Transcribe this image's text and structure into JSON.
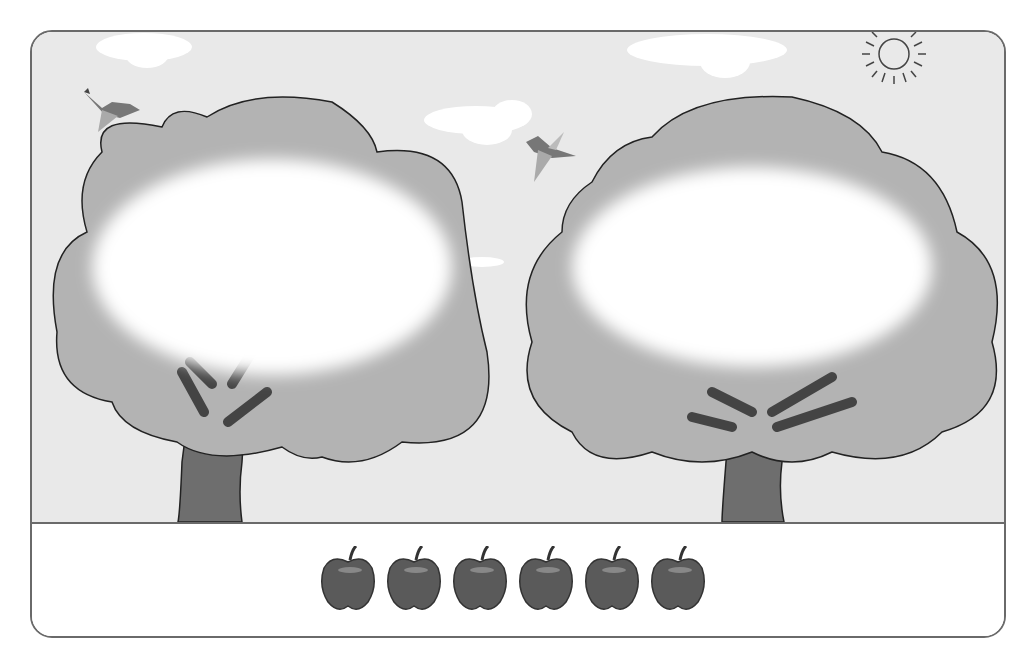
{
  "scene": {
    "trees": [
      {
        "id": "left-tree",
        "blank_label": ""
      },
      {
        "id": "right-tree",
        "blank_label": ""
      }
    ],
    "birds": 2,
    "clouds": 4,
    "sun": true
  },
  "tray": {
    "apple_count": 6,
    "apples": [
      "apple",
      "apple",
      "apple",
      "apple",
      "apple",
      "apple"
    ]
  },
  "colors": {
    "sky": "#e9e9e9",
    "foliage": "#b3b3b3",
    "trunk": "#6e6e6e",
    "apple": "#5a5a5a",
    "border": "#6a6a6a"
  }
}
